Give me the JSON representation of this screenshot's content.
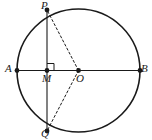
{
  "figure": {
    "background_color": "#ffffff",
    "stroke_color": "#1a1a1a",
    "label_color": "#1a1a1a"
  },
  "circle": {
    "name": "circle-O",
    "center_x": 78.5,
    "center_y": 70.5,
    "radius": 61.5,
    "stroke_width": 1.6,
    "style": "solid"
  },
  "points": [
    {
      "id": "A",
      "label": "A",
      "x": 17,
      "y": 70.5,
      "dot": true,
      "label_x": 5,
      "label_y": 63
    },
    {
      "id": "B",
      "label": "B",
      "x": 140,
      "y": 70.5,
      "dot": true,
      "label_x": 141,
      "label_y": 63
    },
    {
      "id": "O",
      "label": "O",
      "x": 78.5,
      "y": 70.5,
      "dot": true,
      "label_x": 76,
      "label_y": 73
    },
    {
      "id": "M",
      "label": "M",
      "x": 47,
      "y": 70.5,
      "dot": true,
      "label_x": 42,
      "label_y": 73
    },
    {
      "id": "P",
      "label": "P",
      "x": 47,
      "y": 10.0,
      "dot": true,
      "label_x": 41,
      "label_y": 0
    },
    {
      "id": "Q",
      "label": "Q",
      "x": 47,
      "y": 131.0,
      "dot": true,
      "label_x": 41,
      "label_y": 128
    }
  ],
  "segments": [
    {
      "name": "diameter-AB",
      "from": "A",
      "to": "B",
      "style": "solid",
      "stroke_width": 1.1
    },
    {
      "name": "chord-PQ",
      "from": "P",
      "to": "Q",
      "style": "solid",
      "stroke_width": 1.1
    },
    {
      "name": "radius-OP",
      "from": "O",
      "to": "P",
      "style": "dashed",
      "stroke_width": 1.0
    },
    {
      "name": "radius-OQ",
      "from": "O",
      "to": "Q",
      "style": "dashed",
      "stroke_width": 1.0
    }
  ],
  "right_angle": {
    "name": "right-angle-at-M",
    "vertex": "M",
    "x": 47,
    "y": 70.5,
    "size": 7,
    "direction_x": 1,
    "direction_y": -1
  }
}
